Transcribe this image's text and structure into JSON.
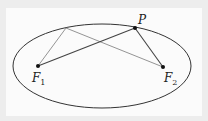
{
  "diagram": {
    "labels": {
      "P": "P",
      "F1_main": "F",
      "F1_sub": "1",
      "F2_main": "F",
      "F2_sub": "2"
    },
    "ellipse": {
      "cx": 102,
      "cy": 66,
      "rx": 89,
      "ry": 42
    },
    "points": {
      "F1": [
        38,
        66
      ],
      "F2": [
        163,
        67
      ],
      "P": [
        135,
        28
      ],
      "Q": [
        66,
        28
      ]
    },
    "colors": {
      "ellipse": "#333333",
      "primary_lines": "#444444",
      "secondary_lines": "#888888",
      "points": "#111111"
    }
  }
}
